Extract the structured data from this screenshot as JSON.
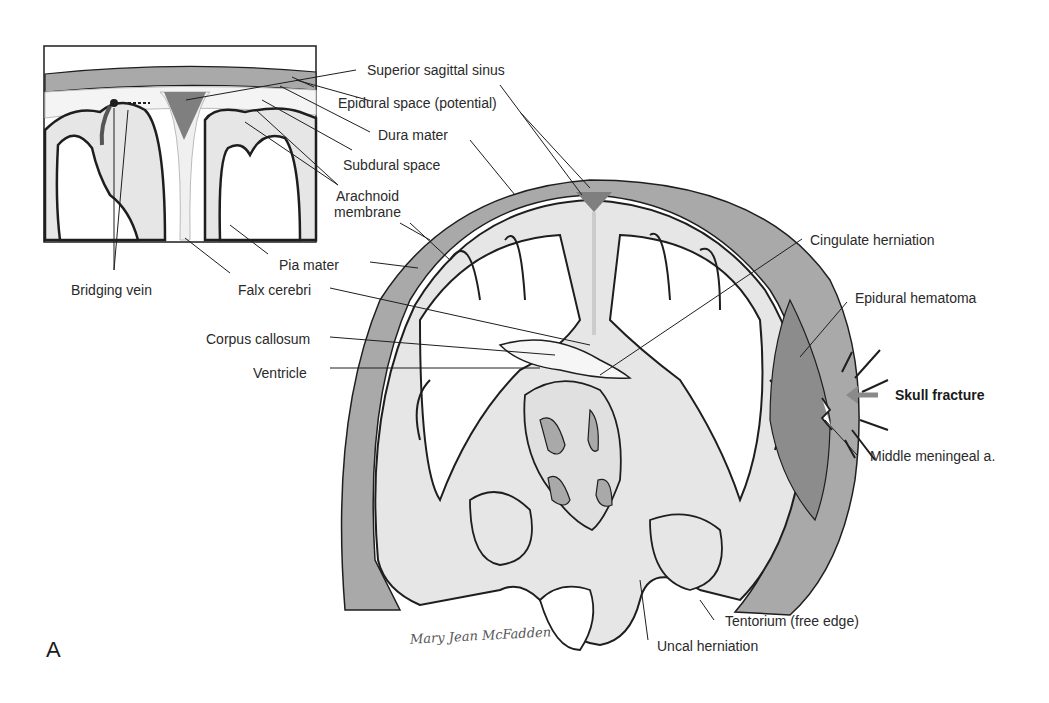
{
  "figure": {
    "panel_letter": "A",
    "signature": "Mary Jean McFadden",
    "colors": {
      "dura_skull": "#a9a9a9",
      "cortex": "#e6e6e6",
      "sinus": "#7f7f7f",
      "hematoma": "#8c8c8c",
      "outline": "#1e1e1e",
      "arrow": "#8a8a8a"
    }
  },
  "inset": {
    "labels": {
      "superior_sagittal_sinus": "Superior sagittal sinus",
      "epidural_space": "Epidural space (potential)",
      "dura_mater": "Dura mater",
      "subdural_space": "Subdural space",
      "arachnoid_line1": "Arachnoid",
      "arachnoid_line2": "membrane",
      "pia_mater": "Pia mater",
      "bridging_vein": "Bridging vein",
      "falx_cerebri": "Falx cerebri"
    }
  },
  "main": {
    "labels": {
      "corpus_callosum": "Corpus callosum",
      "ventricle": "Ventricle",
      "cingulate_herniation": "Cingulate herniation",
      "epidural_hematoma": "Epidural hematoma",
      "skull_fracture": "Skull fracture",
      "middle_meningeal": "Middle meningeal a.",
      "tentorium": "Tentorium (free edge)",
      "uncal_herniation": "Uncal herniation"
    }
  }
}
